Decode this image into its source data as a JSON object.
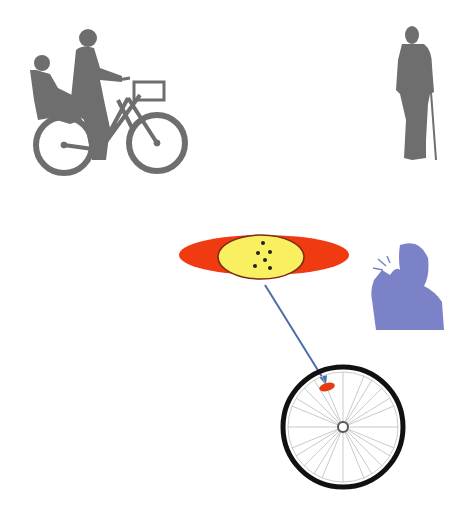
{
  "diagram": {
    "colors": {
      "background": "#ffffff",
      "silhouette_gray": "#6e6e6e",
      "glare_person_blue": "#7b82c8",
      "reflector_outer_red": "#f03a12",
      "reflector_inner_yellow": "#f8f060",
      "reflector_outline": "#7a2a10",
      "dots": "#222222",
      "pointer_arrow": "#4a6ea8",
      "wheel_tire": "#111111",
      "wheel_spokes": "#bbbbbb",
      "wheel_reflector": "#e83a10"
    },
    "elements": [
      {
        "id": "cyclist-with-child",
        "label": "Cyclist carrying child on bicycle"
      },
      {
        "id": "elderly-pedestrian",
        "label": "Elderly pedestrian with cane"
      },
      {
        "id": "reflector-magnified",
        "label": "Magnified reflector (red ellipse with yellow center)"
      },
      {
        "id": "glare-person",
        "label": "Person dazzled by light"
      },
      {
        "id": "bicycle-wheel",
        "label": "Bicycle wheel with spoke reflector"
      }
    ]
  }
}
